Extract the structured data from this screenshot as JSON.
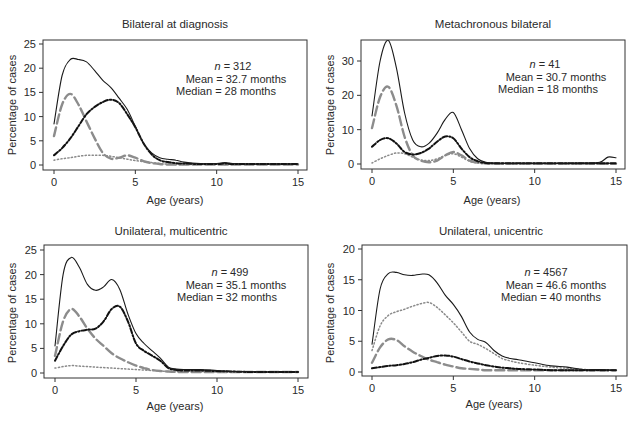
{
  "chart_data": [
    {
      "type": "line",
      "title": "Bilateral at diagnosis",
      "xlabel": "Age (years)",
      "ylabel": "Percentage of cases",
      "xlim": [
        0,
        15
      ],
      "ylim": [
        0,
        25
      ],
      "xticks": [
        0,
        5,
        10,
        15
      ],
      "yticks": [
        0,
        5,
        10,
        15,
        20,
        25
      ],
      "grid": false,
      "annotation": {
        "n": "312",
        "mean": "32.7 months",
        "median": "28 months"
      },
      "x": [
        0,
        0.5,
        1,
        1.5,
        2,
        2.5,
        3,
        3.5,
        4,
        4.5,
        5,
        5.5,
        6,
        6.5,
        7,
        7.5,
        8,
        9,
        10,
        10.5,
        11,
        12,
        13,
        14,
        15
      ],
      "series": [
        {
          "name": "total",
          "style": "solid",
          "values": [
            8.5,
            18.5,
            21.8,
            21.8,
            21.3,
            19.5,
            17.5,
            16,
            13.8,
            11.5,
            8,
            4.5,
            2.5,
            1.5,
            1.2,
            1,
            0.6,
            0.3,
            0.3,
            0.5,
            0.3,
            0.2,
            0.2,
            0.2,
            0.2
          ]
        },
        {
          "name": "series-2",
          "style": "long-dash-gray",
          "values": [
            6,
            12.5,
            14.7,
            12.5,
            9,
            5.5,
            2.5,
            1.3,
            1.5,
            2,
            1.5,
            0.8,
            0.4,
            0.2,
            0.1,
            0.1,
            0.1,
            0.1,
            0.1,
            0.1,
            0.1,
            0.1,
            0.1,
            0.1,
            0.1
          ]
        },
        {
          "name": "series-3",
          "style": "dot-dash-black",
          "values": [
            2,
            3.5,
            5.5,
            8,
            10.5,
            12,
            13,
            13.5,
            12.8,
            10.5,
            7.8,
            4.5,
            2.2,
            1,
            0.6,
            0.4,
            0.3,
            0.2,
            0.2,
            0.3,
            0.2,
            0.2,
            0.2,
            0.2,
            0.2
          ]
        },
        {
          "name": "series-4",
          "style": "dotted-gray",
          "values": [
            1,
            1.3,
            1.5,
            1.8,
            2,
            2,
            2,
            1.8,
            1.5,
            1.2,
            0.9,
            0.7,
            0.5,
            0.3,
            0.2,
            0.1,
            0.1,
            0.1,
            0.1,
            0.1,
            0.1,
            0.1,
            0.1,
            0.1,
            0.1
          ]
        }
      ]
    },
    {
      "type": "line",
      "title": "Metachronous bilateral",
      "xlabel": "Age (years)",
      "ylabel": "Percentage of cases",
      "xlim": [
        0,
        15
      ],
      "ylim": [
        0,
        36
      ],
      "xticks": [
        0,
        5,
        10,
        15
      ],
      "yticks": [
        0,
        10,
        20,
        30
      ],
      "grid": false,
      "annotation": {
        "n": "41",
        "mean": "30.7 months",
        "median": "18 months"
      },
      "x": [
        0,
        0.5,
        1,
        1.5,
        2,
        2.5,
        3,
        3.5,
        4,
        4.5,
        5,
        5.5,
        6,
        6.5,
        7,
        7.5,
        8,
        9,
        10,
        11,
        12,
        13,
        14,
        14.5,
        15
      ],
      "series": [
        {
          "name": "total",
          "style": "solid",
          "values": [
            14,
            30,
            36,
            28,
            15,
            7,
            5,
            6,
            9,
            13,
            15,
            10,
            4.5,
            1.5,
            0.5,
            0.3,
            0.2,
            0.2,
            0.2,
            0.2,
            0.2,
            0.3,
            0.5,
            2,
            1.8
          ]
        },
        {
          "name": "series-2",
          "style": "long-dash-gray",
          "values": [
            10.5,
            19.5,
            22.5,
            17,
            8,
            2.5,
            1,
            0.5,
            1,
            2.5,
            3.5,
            2.5,
            1,
            0.4,
            0.2,
            0.1,
            0.1,
            0.1,
            0.1,
            0.1,
            0.1,
            0.1,
            0.1,
            0.1,
            0.1
          ]
        },
        {
          "name": "series-3",
          "style": "dot-dash-black",
          "values": [
            5,
            7,
            7.5,
            6,
            3.5,
            2.8,
            3.2,
            4.5,
            6.5,
            8,
            7.5,
            4.5,
            2,
            0.8,
            0.3,
            0.2,
            0.2,
            0.2,
            0.2,
            0.2,
            0.2,
            0.2,
            0.2,
            0.2,
            0.2
          ]
        },
        {
          "name": "series-4",
          "style": "dotted-gray",
          "values": [
            0.3,
            1.5,
            2.5,
            3.2,
            3,
            2,
            1.2,
            1,
            1.5,
            2.5,
            3,
            2,
            0.8,
            0.3,
            0.1,
            0.1,
            0.1,
            0.1,
            0.1,
            0.1,
            0.1,
            0.1,
            0.1,
            0.1,
            0.1
          ]
        }
      ]
    },
    {
      "type": "line",
      "title": "Unilateral, multicentric",
      "xlabel": "Age (years)",
      "ylabel": "Percentage of cases",
      "xlim": [
        0,
        15
      ],
      "ylim": [
        0,
        25
      ],
      "xticks": [
        0,
        5,
        10,
        15
      ],
      "yticks": [
        0,
        5,
        10,
        15,
        20,
        25
      ],
      "grid": false,
      "annotation": {
        "n": "499",
        "mean": "35.1 months",
        "median": "32 months"
      },
      "x": [
        0,
        0.5,
        1,
        1.5,
        2,
        2.5,
        3,
        3.5,
        4,
        4.5,
        5,
        5.5,
        6,
        6.5,
        7,
        7.5,
        8,
        9,
        10,
        11,
        12,
        13,
        14,
        15
      ],
      "series": [
        {
          "name": "total",
          "style": "solid",
          "values": [
            5.5,
            20,
            23.5,
            21.5,
            18,
            16.8,
            17.5,
            19,
            17,
            12,
            8,
            6,
            4.5,
            3,
            1.2,
            0.8,
            0.7,
            0.7,
            0.5,
            0.3,
            0.3,
            0.2,
            0.2,
            0.2
          ]
        },
        {
          "name": "series-2",
          "style": "long-dash-gray",
          "values": [
            3.5,
            10.5,
            13,
            11.5,
            9,
            7,
            5.5,
            4,
            3,
            2.2,
            1.5,
            1,
            0.6,
            0.4,
            0.3,
            0.2,
            0.2,
            0.2,
            0.2,
            0.2,
            0.2,
            0.2,
            0.2,
            0.2
          ]
        },
        {
          "name": "series-3",
          "style": "dot-dash-black",
          "values": [
            2.5,
            5.5,
            7.8,
            8.5,
            8.8,
            9,
            10.5,
            13,
            13.5,
            10.5,
            6,
            4.5,
            3.5,
            2.5,
            1,
            0.6,
            0.5,
            0.5,
            0.4,
            0.3,
            0.2,
            0.2,
            0.2,
            0.2
          ]
        },
        {
          "name": "series-4",
          "style": "dotted-gray",
          "values": [
            1,
            1.3,
            1.5,
            1.4,
            1.3,
            1.2,
            1.1,
            1,
            0.9,
            0.8,
            0.7,
            0.6,
            0.5,
            0.4,
            0.3,
            0.3,
            0.3,
            0.3,
            0.2,
            0.2,
            0.2,
            0.2,
            0.2,
            0.2
          ]
        }
      ]
    },
    {
      "type": "line",
      "title": "Unilateral, unicentric",
      "xlabel": "Age (years)",
      "ylabel": "Percentage of cases",
      "xlim": [
        0,
        15
      ],
      "ylim": [
        0,
        20
      ],
      "xticks": [
        0,
        5,
        10,
        15
      ],
      "yticks": [
        0,
        5,
        10,
        15,
        20
      ],
      "grid": false,
      "annotation": {
        "n": "4567",
        "mean": "46.6 months",
        "median": "40 months"
      },
      "x": [
        0,
        0.5,
        1,
        1.5,
        2,
        2.5,
        3,
        3.5,
        4,
        4.5,
        5,
        5.5,
        6,
        6.5,
        7,
        7.5,
        8,
        8.5,
        9,
        10,
        11,
        12,
        13,
        14,
        15
      ],
      "series": [
        {
          "name": "total",
          "style": "solid",
          "values": [
            4.5,
            13.5,
            16,
            16.2,
            15.8,
            15.7,
            15.9,
            15.8,
            14.5,
            12.5,
            11,
            9,
            6.5,
            5.3,
            4.8,
            3.5,
            2.6,
            2.2,
            2,
            1.5,
            1,
            0.8,
            0.4,
            0.4,
            0.3
          ]
        },
        {
          "name": "series-2",
          "style": "long-dash-gray",
          "values": [
            1.5,
            4,
            5.3,
            5.2,
            4.2,
            3.3,
            2.6,
            2,
            1.6,
            1.2,
            0.9,
            0.6,
            0.5,
            0.4,
            0.3,
            0.3,
            0.3,
            0.3,
            0.3,
            0.3,
            0.3,
            0.3,
            0.3,
            0.3,
            0.3
          ]
        },
        {
          "name": "series-3",
          "style": "dot-dash-black",
          "values": [
            0.6,
            0.8,
            1,
            1.1,
            1.3,
            1.6,
            2,
            2.3,
            2.6,
            2.7,
            2.5,
            2.1,
            1.7,
            1.4,
            1.1,
            0.9,
            0.7,
            0.6,
            0.5,
            0.4,
            0.3,
            0.3,
            0.3,
            0.3,
            0.3
          ]
        },
        {
          "name": "series-4",
          "style": "dotted-gray",
          "values": [
            3.5,
            7.5,
            9.2,
            9.8,
            10.2,
            10.7,
            11.1,
            11.3,
            10.5,
            9.3,
            8,
            6.5,
            5,
            4.5,
            3.8,
            3,
            2.2,
            1.8,
            1.5,
            1.1,
            0.8,
            0.6,
            0.4,
            0.3,
            0.3
          ]
        }
      ]
    }
  ],
  "panels": [
    {
      "title": "Bilateral at diagnosis",
      "xlabel": "Age (years)",
      "ylabel": "Percentage of cases",
      "n_label": "n",
      "n_value": "= 312",
      "mean_text": "Mean = 32.7 months",
      "median_text": "Median = 28 months"
    },
    {
      "title": "Metachronous bilateral",
      "xlabel": "Age (years)",
      "ylabel": "Percentage of cases",
      "n_label": "n",
      "n_value": "= 41",
      "mean_text": "Mean = 30.7 months",
      "median_text": "Median = 18 months"
    },
    {
      "title": "Unilateral, multicentric",
      "xlabel": "Age (years)",
      "ylabel": "Percentage of cases",
      "n_label": "n",
      "n_value": "= 499",
      "mean_text": "Mean = 35.1 months",
      "median_text": "Median = 32 months"
    },
    {
      "title": "Unilateral, unicentric",
      "xlabel": "Age (years)",
      "ylabel": "Percentage of cases",
      "n_label": "n",
      "n_value": "= 4567",
      "mean_text": "Mean = 46.6 months",
      "median_text": "Median = 40 months"
    }
  ],
  "styles": {
    "solid": {
      "color": "#1a1a1a",
      "width": 1.1,
      "dash": ""
    },
    "long-dash-gray": {
      "color": "#8c8c8c",
      "width": 2.4,
      "dash": "9,4"
    },
    "dot-dash-black": {
      "color": "#111111",
      "width": 2.0,
      "dash": "5,2,1.5,2"
    },
    "dotted-gray": {
      "color": "#8a8a8a",
      "width": 1.5,
      "dash": "1.2,2.3"
    }
  }
}
